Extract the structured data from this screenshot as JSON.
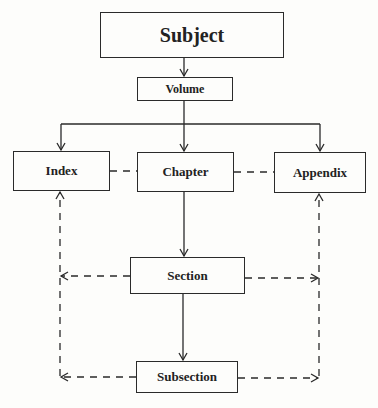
{
  "diagram": {
    "nodes": {
      "subject": "Subject",
      "volume": "Volume",
      "index": "Index",
      "chapter": "Chapter",
      "appendix": "Appendix",
      "section": "Section",
      "subsection": "Subsection"
    },
    "edges": [
      {
        "from": "Subject",
        "to": "Volume",
        "style": "solid"
      },
      {
        "from": "Volume",
        "to": "Index",
        "style": "solid"
      },
      {
        "from": "Volume",
        "to": "Chapter",
        "style": "solid"
      },
      {
        "from": "Volume",
        "to": "Appendix",
        "style": "solid"
      },
      {
        "from": "Chapter",
        "to": "Section",
        "style": "solid"
      },
      {
        "from": "Section",
        "to": "Subsection",
        "style": "solid"
      },
      {
        "from": "Index",
        "to": "Chapter",
        "style": "dashed"
      },
      {
        "from": "Chapter",
        "to": "Appendix",
        "style": "dashed"
      },
      {
        "from": "Section",
        "to": "Index",
        "style": "dashed"
      },
      {
        "from": "Section",
        "to": "Appendix",
        "style": "dashed"
      },
      {
        "from": "Subsection",
        "to": "Index",
        "style": "dashed"
      },
      {
        "from": "Subsection",
        "to": "Appendix",
        "style": "dashed"
      }
    ]
  }
}
